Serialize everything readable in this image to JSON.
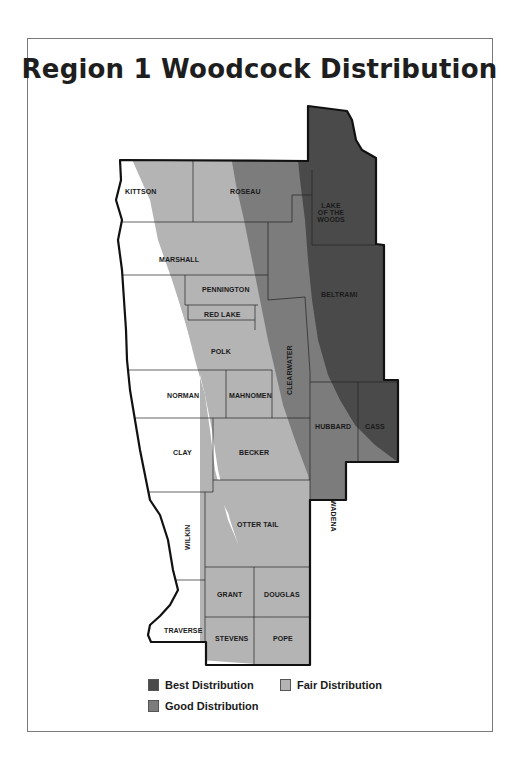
{
  "title": "Region 1 Woodcock Distribution",
  "colors": {
    "best": "#4a4a4a",
    "good": "#7c7c7c",
    "fair": "#b4b4b4",
    "none": "#ffffff",
    "border": "#111111"
  },
  "counties": {
    "kittson": "KITTSON",
    "roseau": "ROSEAU",
    "lake_of_the_woods_1": "LAKE",
    "lake_of_the_woods_2": "OF THE",
    "lake_of_the_woods_3": "WOODS",
    "marshall": "MARSHALL",
    "pennington": "PENNINGTON",
    "red_lake": "RED LAKE",
    "beltrami": "BELTRAMI",
    "polk": "POLK",
    "clearwater": "CLEARWATER",
    "norman": "NORMAN",
    "mahnomen": "MAHNOMEN",
    "hubbard": "HUBBARD",
    "cass": "CASS",
    "clay": "CLAY",
    "becker": "BECKER",
    "wadena": "WADENA",
    "wilkin": "WILKIN",
    "otter_tail": "OTTER TAIL",
    "grant": "GRANT",
    "douglas": "DOUGLAS",
    "traverse": "TRAVERSE",
    "stevens": "STEVENS",
    "pope": "POPE"
  },
  "legend": {
    "best": "Best Distribution",
    "fair": "Fair Distribution",
    "good": "Good Distribution"
  }
}
